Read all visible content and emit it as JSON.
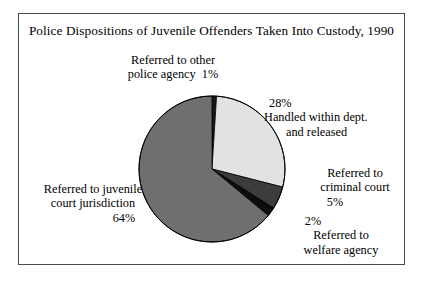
{
  "chart_data": {
    "type": "pie",
    "title": "Police Dispositions of Juvenile Offenders Taken Into Custody, 1990",
    "xlabel": "",
    "ylabel": "",
    "legend_position": "none",
    "grid": false,
    "start_angle_deg": 0,
    "direction": "clockwise",
    "categories": [
      "Referred to other police agency",
      "Handled within dept. and released",
      "Referred to criminal court",
      "Referred to welfare agency",
      "Referred to juvenile court jurisdiction"
    ],
    "values": [
      1,
      28,
      5,
      2,
      64
    ],
    "value_labels": [
      "1%",
      "28%",
      "5%",
      "2%",
      "64%"
    ],
    "colors": [
      "#1a1a1a",
      "#e2e2e2",
      "#3c3c3c",
      "#0d0d0d",
      "#6f6f6f"
    ],
    "slices": [
      {
        "label": "Referred to other police agency",
        "value": 1,
        "value_label": "1%",
        "color": "#1a1a1a"
      },
      {
        "label": "Handled within dept. and released",
        "value": 28,
        "value_label": "28%",
        "color": "#e2e2e2"
      },
      {
        "label": "Referred to criminal court",
        "value": 5,
        "value_label": "5%",
        "color": "#3c3c3c"
      },
      {
        "label": "Referred to welfare agency",
        "value": 2,
        "value_label": "2%",
        "color": "#0d0d0d"
      },
      {
        "label": "Referred to juvenile court jurisdiction",
        "value": 64,
        "value_label": "64%",
        "color": "#6f6f6f"
      }
    ]
  },
  "labels": {
    "police_agency": {
      "line1": "Referred to other",
      "line2": "police agency",
      "pct": "1%"
    },
    "handled": {
      "pct": "28%",
      "line1": "Handled within dept.",
      "line2": "and released"
    },
    "criminal_court": {
      "line1": "Referred to",
      "line2": "criminal court",
      "pct": "5%"
    },
    "welfare_agency": {
      "pct": "2%",
      "line1": "Referred to",
      "line2": "welfare agency"
    },
    "juvenile_court": {
      "line1": "Referred to juvenile",
      "line2": "court jurisdiction",
      "pct": "64%"
    }
  },
  "style": {
    "pie_outline": "#000000",
    "frame_border": "#4a4a4a",
    "background": "#ffffff"
  }
}
